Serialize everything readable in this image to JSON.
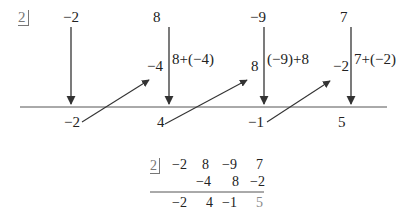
{
  "diagram": {
    "divisor": "2",
    "coefficients": [
      "−2",
      "8",
      "−9",
      "7"
    ],
    "products": [
      "−4",
      "8",
      "−2"
    ],
    "sum_expressions": [
      "8+(−4)",
      "(−9)+8",
      "7+(−2)"
    ],
    "results": [
      "−2",
      "4",
      "−1",
      "5"
    ]
  },
  "summary_table": {
    "divisor": "2",
    "row1": [
      "−2",
      "8",
      "−9",
      "7"
    ],
    "row2": [
      "−4",
      "8",
      "−2"
    ],
    "row3": [
      "−2",
      "4",
      "−1",
      "5"
    ]
  },
  "colors": {
    "ink": "#222222",
    "divisor": "#777777",
    "remainder": "#888888"
  }
}
